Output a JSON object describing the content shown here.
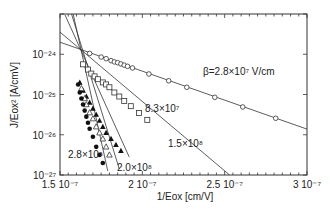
{
  "chart_data": {
    "type": "scatter",
    "title": "",
    "xlabel": "1/Eox [cm/V]",
    "ylabel": "J/Eox² [A/cmV]",
    "xlim": [
      1.5e-07,
      3e-07
    ],
    "ylim_log10": [
      -27,
      -23
    ],
    "yscale": "log",
    "grid": false,
    "x_ticks": [
      {
        "value": 1.5e-07,
        "label": "1.5 10⁻⁷"
      },
      {
        "value": 2e-07,
        "label": "2 10⁻⁷"
      },
      {
        "value": 2.5e-07,
        "label": "2.5 10⁻⁷"
      },
      {
        "value": 3e-07,
        "label": "3 10⁻⁷"
      }
    ],
    "y_ticks": [
      {
        "log10": -24,
        "label": "10⁻²⁴"
      },
      {
        "log10": -25,
        "label": "10⁻²⁵"
      },
      {
        "log10": -26,
        "label": "10⁻²⁶"
      },
      {
        "log10": -27,
        "label": "10⁻²⁷"
      }
    ],
    "series": [
      {
        "name": "β=2.8×10⁷ V/cm",
        "marker": "open-circle",
        "beta": 28000000.0,
        "fit": {
          "x": [
            1.5e-07,
            3e-07
          ],
          "log10y": [
            -23.7,
            -25.86
          ]
        },
        "points": {
          "x": [
            1.68e-07,
            1.75e-07,
            1.78e-07,
            1.81e-07,
            1.83e-07,
            1.85e-07,
            1.87e-07,
            1.89e-07,
            1.91e-07,
            1.94e-07,
            2.04e-07,
            2.16e-07,
            2.27e-07,
            2.44e-07,
            2.61e-07,
            2.81e-07
          ],
          "log10y": [
            -23.98,
            -24.07,
            -24.11,
            -24.16,
            -24.19,
            -24.21,
            -24.24,
            -24.27,
            -24.3,
            -24.34,
            -24.49,
            -24.66,
            -24.82,
            -25.07,
            -25.31,
            -25.59
          ]
        }
      },
      {
        "name": "8.3×10⁷",
        "marker": "open-square",
        "beta": 83000000.0,
        "fit": {
          "x": [
            1.5e-07,
            2.53e-07
          ],
          "log10y": [
            -23.45,
            -27.0
          ]
        },
        "points": {
          "x": [
            1.64e-07,
            1.67e-07,
            1.69e-07,
            1.71e-07,
            1.73e-07,
            1.76e-07,
            1.78e-07,
            1.8e-07,
            1.83e-07,
            1.86e-07,
            1.89e-07,
            1.93e-07,
            1.98e-07,
            2.03e-07
          ],
          "log10y": [
            -24.25,
            -24.38,
            -24.48,
            -24.55,
            -24.62,
            -24.7,
            -24.75,
            -24.82,
            -24.95,
            -25.05,
            -25.16,
            -25.29,
            -25.46,
            -25.63
          ]
        }
      },
      {
        "name": "1.5×10⁸",
        "marker": "filled-triangle",
        "beta": 150000000.0,
        "fit": {
          "x": [
            1.53e-07,
            1.92e-07
          ],
          "log10y": [
            -23.02,
            -26.55
          ]
        },
        "points": {
          "x": [
            1.62e-07,
            1.64e-07,
            1.66e-07,
            1.68e-07,
            1.7e-07,
            1.72e-07,
            1.74e-07,
            1.76e-07,
            1.78e-07,
            1.81e-07,
            1.84e-07,
            1.87e-07
          ],
          "log10y": [
            -24.7,
            -24.9,
            -25.05,
            -25.2,
            -25.35,
            -25.5,
            -25.65,
            -25.8,
            -25.95,
            -26.1,
            -26.25,
            -26.4
          ]
        }
      },
      {
        "name": "2.0×10⁸",
        "marker": "open-triangle",
        "beta": 200000000.0,
        "fit": {
          "x": [
            1.57e-07,
            1.86e-07
          ],
          "log10y": [
            -23.0,
            -26.85
          ]
        },
        "points": {
          "x": [
            1.63e-07,
            1.65e-07,
            1.66e-07,
            1.68e-07,
            1.7e-07,
            1.72e-07,
            1.74e-07,
            1.76e-07,
            1.78e-07,
            1.8e-07
          ],
          "log10y": [
            -24.85,
            -25.1,
            -25.25,
            -25.45,
            -25.6,
            -25.8,
            -25.95,
            -26.1,
            -26.3,
            -26.5
          ]
        }
      },
      {
        "name": "2.8×10⁸",
        "marker": "filled-circle",
        "beta": 280000000.0,
        "fit": {
          "x": [
            1.58e-07,
            1.79e-07
          ],
          "log10y": [
            -23.0,
            -26.9
          ]
        },
        "points": {
          "x": [
            1.61e-07,
            1.62e-07,
            1.63e-07,
            1.64e-07,
            1.65e-07,
            1.66e-07,
            1.67e-07,
            1.68e-07,
            1.7e-07,
            1.72e-07,
            1.74e-07,
            1.76e-07
          ],
          "log10y": [
            -24.75,
            -24.95,
            -25.1,
            -25.25,
            -25.4,
            -25.55,
            -25.7,
            -25.85,
            -26.05,
            -26.3,
            -26.5,
            -26.7
          ]
        }
      }
    ],
    "annotations": [
      {
        "text": "β=2.8×10⁷ V/cm",
        "x": 203,
        "y": 75
      },
      {
        "text": "8.3×10⁷",
        "x": 145,
        "y": 112
      },
      {
        "text": "1.5×10⁸",
        "x": 168,
        "y": 147
      },
      {
        "text": "2.8×10⁸",
        "x": 68,
        "y": 158
      },
      {
        "text": "2.0×10⁸",
        "x": 117,
        "y": 171
      }
    ]
  }
}
